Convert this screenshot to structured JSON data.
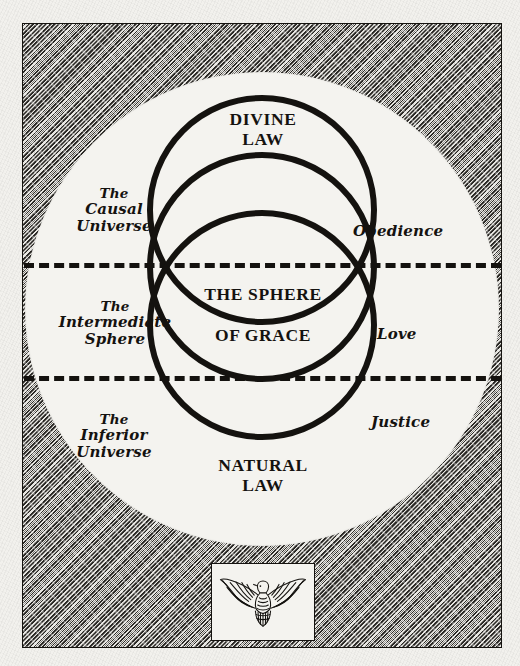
{
  "plate": {
    "title": "The Sphere of Grace diagram",
    "frame_color": "#14120f",
    "paper_color": "#f2f1ed",
    "hatch_color": "#1b1916"
  },
  "circles": {
    "divine": {
      "line1": "DIVINE",
      "line2": "LAW"
    },
    "grace": {
      "line1": "THE SPHERE",
      "line2": "OF GRACE"
    },
    "natural": {
      "line1": "NATURAL",
      "line2": "LAW"
    }
  },
  "left_labels": [
    {
      "the": "The",
      "line2": "Causal",
      "line3": "Universe"
    },
    {
      "the": "The",
      "line2": "Intermediate",
      "line3": "Sphere"
    },
    {
      "the": "The",
      "line2": "Inferior",
      "line3": "Universe"
    }
  ],
  "right_labels": [
    {
      "text": "Obedience"
    },
    {
      "text": "Love"
    },
    {
      "text": "Justice"
    }
  ],
  "dividers": [
    {
      "style": "dashed"
    },
    {
      "style": "dashed"
    }
  ],
  "emblem": {
    "icon": "dove-icon",
    "description": "descending dove with outspread wings"
  }
}
